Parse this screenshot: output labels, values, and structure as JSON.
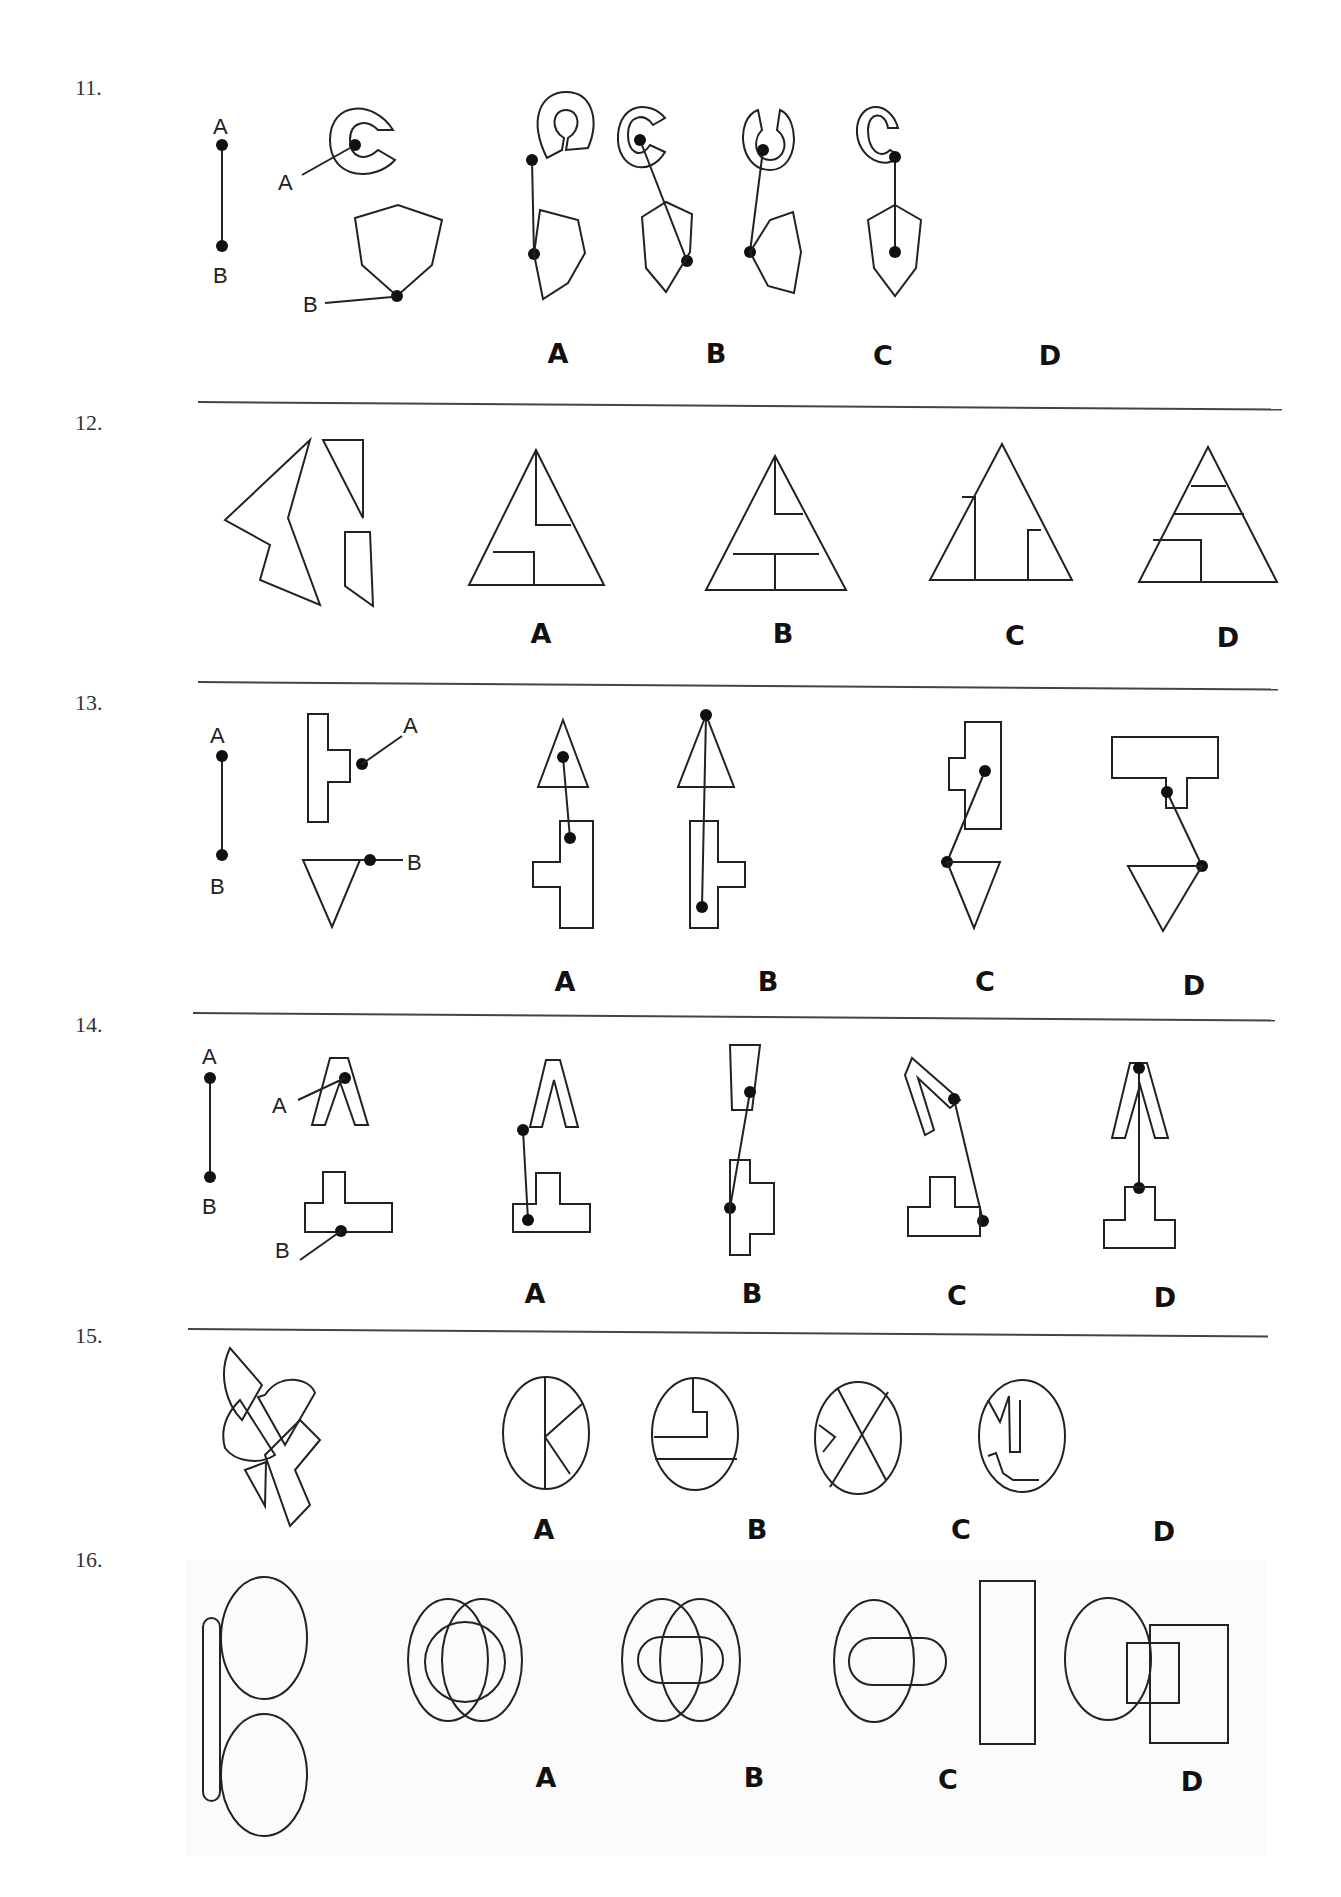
{
  "questions": [
    {
      "number": "11.",
      "option_labels": [
        "A",
        "B",
        "C",
        "D"
      ],
      "point_labels": [
        "A",
        "B",
        "A",
        "B"
      ]
    },
    {
      "number": "12.",
      "option_labels": [
        "A",
        "B",
        "C",
        "D"
      ]
    },
    {
      "number": "13.",
      "option_labels": [
        "A",
        "B",
        "C",
        "D"
      ],
      "point_labels": [
        "A",
        "B",
        "A",
        "B"
      ]
    },
    {
      "number": "14.",
      "option_labels": [
        "A",
        "B",
        "C",
        "D"
      ],
      "point_labels": [
        "A",
        "B",
        "A",
        "B"
      ]
    },
    {
      "number": "15.",
      "option_labels": [
        "A",
        "B",
        "C",
        "D"
      ]
    },
    {
      "number": "16.",
      "option_labels": [
        "A",
        "B",
        "C",
        "D"
      ]
    }
  ]
}
